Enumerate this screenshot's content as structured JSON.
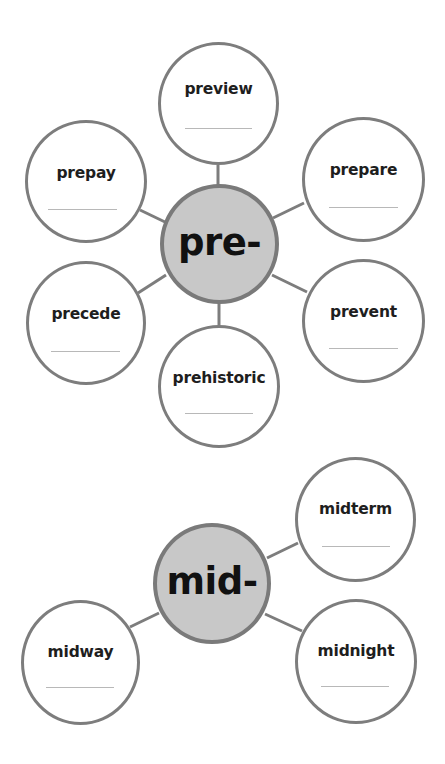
{
  "colors": {
    "hub_fill": "#c8c8c8",
    "hub_border": "#7a7a7a",
    "node_border": "#7d7d7d",
    "connector": "#7d7d7d",
    "blank_line": "#b8b8b8",
    "text": "#1e1e1e"
  },
  "webs": [
    {
      "prefix": "pre-",
      "words": [
        "preview",
        "prepay",
        "prepare",
        "precede",
        "prevent",
        "prehistoric"
      ]
    },
    {
      "prefix": "mid-",
      "words": [
        "midterm",
        "midway",
        "midnight"
      ]
    }
  ]
}
